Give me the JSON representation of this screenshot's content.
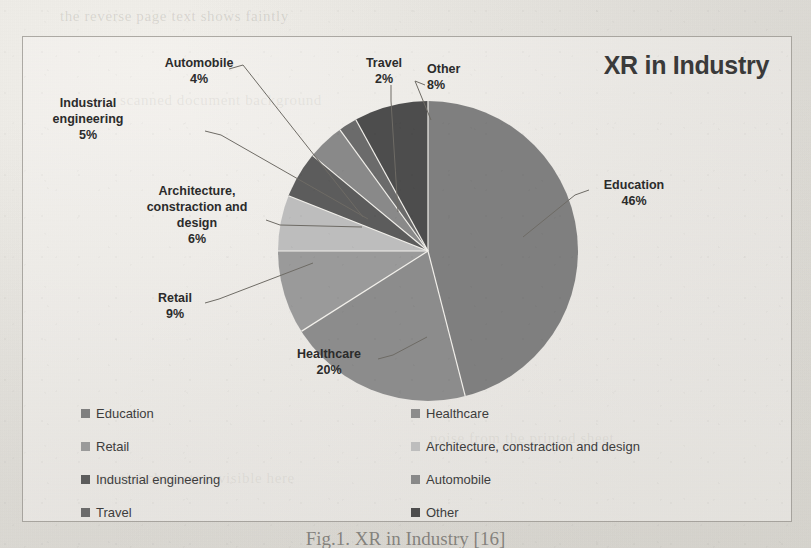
{
  "chart_data": {
    "type": "pie",
    "title": "XR in Industry",
    "categories": [
      "Education",
      "Healthcare",
      "Retail",
      "Architecture, constraction and design",
      "Industrial engineering",
      "Automobile",
      "Travel",
      "Other"
    ],
    "values": [
      46,
      20,
      9,
      6,
      5,
      4,
      2,
      8
    ],
    "value_suffix": "%",
    "colors": [
      "#7f7f7f",
      "#8c8c8c",
      "#9a9a9a",
      "#bdbdbd",
      "#5c5c5c",
      "#898989",
      "#6b6b6b",
      "#4d4d4d"
    ],
    "legend_position": "bottom",
    "grid": false,
    "labels": [
      {
        "name": "Education",
        "pct": "46%"
      },
      {
        "name": "Healthcare",
        "pct": "20%"
      },
      {
        "name": "Retail",
        "pct": "9%"
      },
      {
        "name": "Architecture, constraction and design",
        "pct": "6%",
        "lines": [
          "Architecture,",
          "constraction and",
          "design"
        ]
      },
      {
        "name": "Industrial engineering",
        "pct": "5%",
        "lines": [
          "Industrial",
          "engineering"
        ]
      },
      {
        "name": "Automobile",
        "pct": "4%"
      },
      {
        "name": "Travel",
        "pct": "2%"
      },
      {
        "name": "Other",
        "pct": "8%"
      }
    ]
  },
  "chart": {
    "title": "XR in Industry"
  },
  "callouts": {
    "automobile": {
      "line1": "Automobile",
      "pct": "4%"
    },
    "travel": {
      "line1": "Travel",
      "pct": "2%"
    },
    "other": {
      "line1": "Other",
      "pct": "8%"
    },
    "industrial": {
      "line1": "Industrial",
      "line2": "engineering",
      "pct": "5%"
    },
    "architecture": {
      "line1": "Architecture,",
      "line2": "constraction and",
      "line3": "design",
      "pct": "6%"
    },
    "retail": {
      "line1": "Retail",
      "pct": "9%"
    },
    "healthcare": {
      "line1": "Healthcare",
      "pct": "20%"
    },
    "education": {
      "line1": "Education",
      "pct": "46%"
    }
  },
  "legend": {
    "left": [
      {
        "label": "Education",
        "color": "#7f7f7f"
      },
      {
        "label": "Retail",
        "color": "#9a9a9a"
      },
      {
        "label": "Industrial engineering",
        "color": "#5c5c5c"
      },
      {
        "label": "Travel",
        "color": "#6b6b6b"
      }
    ],
    "right": [
      {
        "label": "Healthcare",
        "color": "#8c8c8c"
      },
      {
        "label": "Architecture, constraction and design",
        "color": "#bdbdbd"
      },
      {
        "label": "Automobile",
        "color": "#898989"
      },
      {
        "label": "Other",
        "color": "#4d4d4d"
      }
    ]
  },
  "caption": {
    "text": "Fig.1. XR in Industry [16]"
  },
  "bleed_through": {
    "lines": [
      "the reverse page text shows faintly",
      "scanned document background",
      "noise from the printed sheet",
      "partial characters visible here"
    ]
  }
}
